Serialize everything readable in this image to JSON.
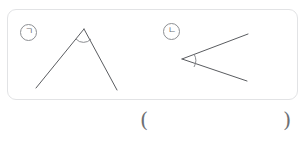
{
  "panel": {
    "border_color": "#e2e3e5",
    "background_color": "#ffffff",
    "labels": [
      {
        "id": "giyeok",
        "text": "㉠",
        "display_char": "ㄱ"
      },
      {
        "id": "nieun",
        "text": "㉡",
        "display_char": "ㄴ"
      }
    ]
  },
  "figures": [
    {
      "id": "figure-giyeok",
      "label": "㉠",
      "shape": "inverted-v-angle",
      "description": "Angle opening downward, vertex at top",
      "stroke_color": "#5a5c60",
      "vertex": {
        "x": 76,
        "y": 27
      },
      "rays": [
        {
          "to_x": 35,
          "to_y": 86
        },
        {
          "to_x": 116,
          "to_y": 88
        }
      ],
      "angle_mark": "arc"
    },
    {
      "id": "figure-nieun",
      "label": "㉡",
      "shape": "left-pointing-angle",
      "description": "Angle opening to the right, vertex at left",
      "stroke_color": "#5a5c60",
      "vertex": {
        "x": 181,
        "y": 57
      },
      "rays": [
        {
          "to_x": 247,
          "to_y": 32
        },
        {
          "to_x": 246,
          "to_y": 79
        }
      ],
      "angle_mark": "arc"
    }
  ],
  "answer": {
    "open_paren": "(",
    "close_paren": ")",
    "value": "",
    "placeholder": ""
  }
}
